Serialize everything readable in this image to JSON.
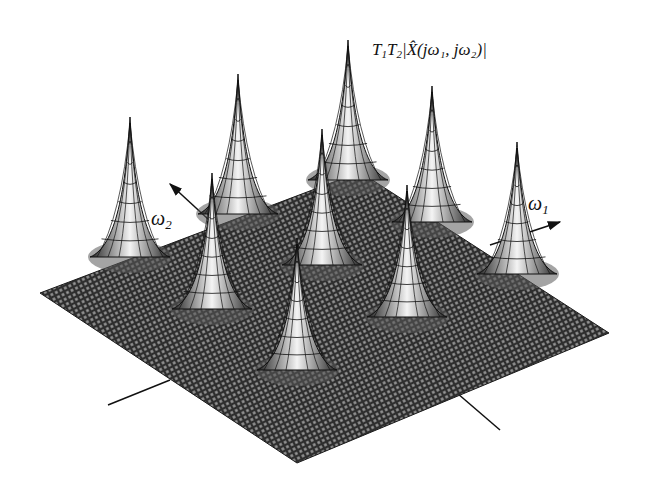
{
  "diagram": {
    "type": "3d-mesh-surface",
    "z_axis_label": {
      "prefix": "T",
      "sub1": "1",
      "mid": "T",
      "sub2": "2",
      "expr": "|X̂(jω₁, jω₂)|"
    },
    "axis_w1": {
      "symbol": "ω",
      "sub": "1"
    },
    "axis_w2": {
      "symbol": "ω",
      "sub": "2"
    },
    "peaks": [
      {
        "row": 0,
        "col": 0,
        "x": 130,
        "y": 117
      },
      {
        "row": 0,
        "col": 1,
        "x": 238,
        "y": 74
      },
      {
        "row": 0,
        "col": 2,
        "x": 348,
        "y": 40
      },
      {
        "row": 1,
        "col": 0,
        "x": 212,
        "y": 173
      },
      {
        "row": 1,
        "col": 1,
        "x": 322,
        "y": 129
      },
      {
        "row": 1,
        "col": 2,
        "x": 432,
        "y": 86
      },
      {
        "row": 2,
        "col": 0,
        "x": 297,
        "y": 238
      },
      {
        "row": 2,
        "col": 1,
        "x": 407,
        "y": 185
      },
      {
        "row": 2,
        "col": 2,
        "x": 517,
        "y": 142
      }
    ],
    "colors": {
      "mesh": "#2a2a2a",
      "peak_fill": "#f2f2f2",
      "ink": "#111111",
      "background": "#ffffff"
    }
  }
}
